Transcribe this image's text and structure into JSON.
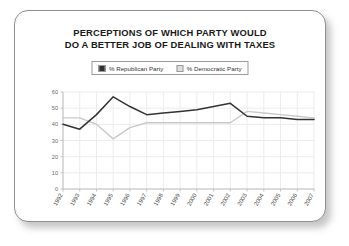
{
  "chart_data": {
    "type": "line",
    "title": "PERCEPTIONS OF WHICH PARTY WOULD DO A BETTER JOB OF DEALING WITH TAXES",
    "title_lines": [
      "PERCEPTIONS OF WHICH PARTY WOULD",
      "DO A BETTER JOB OF DEALING WITH TAXES"
    ],
    "xlabel": "",
    "ylabel": "",
    "ylim": [
      0,
      60
    ],
    "yticks": [
      0,
      10,
      20,
      30,
      40,
      50,
      60
    ],
    "ytick_labels": [
      "0",
      "10",
      "20",
      "30",
      "40",
      "50",
      "60"
    ],
    "grid": true,
    "legend_position": "top-center",
    "categories": [
      "1992",
      "1993",
      "1994",
      "1995",
      "1996",
      "1997",
      "1998",
      "1999",
      "2000",
      "2001",
      "2002",
      "2003",
      "2004",
      "2005",
      "2006",
      "2007"
    ],
    "series": [
      {
        "name": "% Republican Party",
        "color": "#333333",
        "values": [
          40,
          37,
          46,
          57,
          51,
          46,
          47,
          48,
          49,
          51,
          53,
          45,
          44,
          44,
          43,
          43
        ]
      },
      {
        "name": "% Democratic Party",
        "color": "#c9c9c9",
        "values": [
          44,
          44,
          40,
          31,
          38,
          41,
          41,
          41,
          41,
          41,
          41,
          48,
          47,
          46,
          45,
          44
        ]
      }
    ]
  },
  "legend": {
    "items": [
      {
        "label": "% Republican Party",
        "color": "#333333"
      },
      {
        "label": "% Democratic Party",
        "color": "#c9c9c9"
      }
    ]
  },
  "colors": {
    "republican": "#333333",
    "democratic": "#c9c9c9",
    "grid": "#ececec",
    "axis": "#c0c0c0",
    "border": "#8f8f8f",
    "text": "#1a1a1a"
  }
}
